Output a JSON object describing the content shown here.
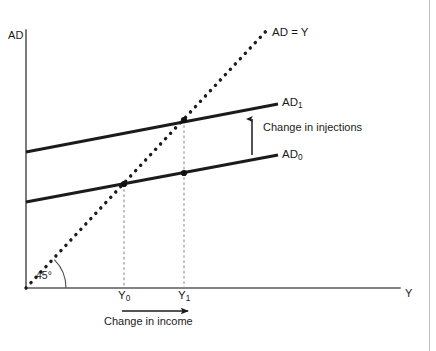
{
  "figure": {
    "domain": "Diagram",
    "kind": "45-degree Keynesian cross diagram",
    "background_color": "#ffffff",
    "ink_color": "#1b1b1b",
    "border_color": "#b9b9b9"
  },
  "axes": {
    "y_axis_label": "AD",
    "x_axis_label": "Y",
    "origin": {
      "x": 26,
      "y": 288
    },
    "y_axis_top": 30,
    "x_axis_right": 400,
    "axis_color": "#555555"
  },
  "lines": {
    "identity": {
      "label": "AD = Y",
      "style": "dotted",
      "from": {
        "x": 26,
        "y": 288
      },
      "to": {
        "x": 268,
        "y": 29
      },
      "label_pos": {
        "x": 272,
        "y": 27
      }
    },
    "ad1": {
      "label": "AD",
      "subscript": "1",
      "style": "solid",
      "from": {
        "x": 26,
        "y": 152
      },
      "to": {
        "x": 278,
        "y": 104
      },
      "label_pos": {
        "x": 282,
        "y": 97
      }
    },
    "ad0": {
      "label": "AD",
      "subscript": "0",
      "style": "solid",
      "from": {
        "x": 26,
        "y": 202
      },
      "to": {
        "x": 278,
        "y": 155
      },
      "label_pos": {
        "x": 282,
        "y": 149
      }
    }
  },
  "angle": {
    "label": "45°",
    "label_pos": {
      "x": 36,
      "y": 270
    },
    "arc_radius": 40
  },
  "equilibria": [
    {
      "name": "initial-equilibrium",
      "x": 124,
      "y": 184,
      "on": "AD0"
    },
    {
      "name": "new-equilibrium",
      "x": 184,
      "y": 120,
      "on": "AD1"
    }
  ],
  "markers": [
    {
      "name": "point-on-ad0-at-y1",
      "x": 184,
      "y": 173,
      "on": "AD0"
    }
  ],
  "drop_lines": [
    {
      "name": "y0-drop-line",
      "x": 124,
      "from_y": 184,
      "to_y": 288
    },
    {
      "name": "y1-drop-line",
      "x": 184,
      "from_y": 120,
      "to_y": 288
    }
  ],
  "tick_labels": [
    {
      "name": "y0",
      "text": "Y",
      "subscript": "0",
      "x": 118,
      "y": 290
    },
    {
      "name": "y1",
      "text": "Y",
      "subscript": "1",
      "x": 178,
      "y": 290
    }
  ],
  "annotations": {
    "injections": {
      "text": "Change in injections",
      "text_pos": {
        "x": 263,
        "y": 123
      },
      "arrow": {
        "x": 252,
        "from_y": 155,
        "to_y": 117,
        "direction": "up"
      }
    },
    "income": {
      "text": "Change in income",
      "text_pos": {
        "x": 104,
        "y": 315
      },
      "arrow": {
        "y": 311,
        "from_x": 122,
        "to_x": 189,
        "direction": "right"
      }
    }
  }
}
